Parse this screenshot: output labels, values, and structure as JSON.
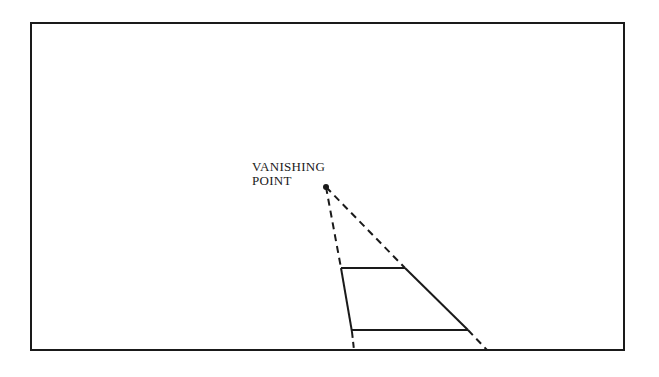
{
  "diagram": {
    "label": {
      "line1": "VANISHING",
      "line2": "POINT"
    },
    "colors": {
      "ink": "#1a1a1a",
      "background": "#ffffff"
    }
  }
}
